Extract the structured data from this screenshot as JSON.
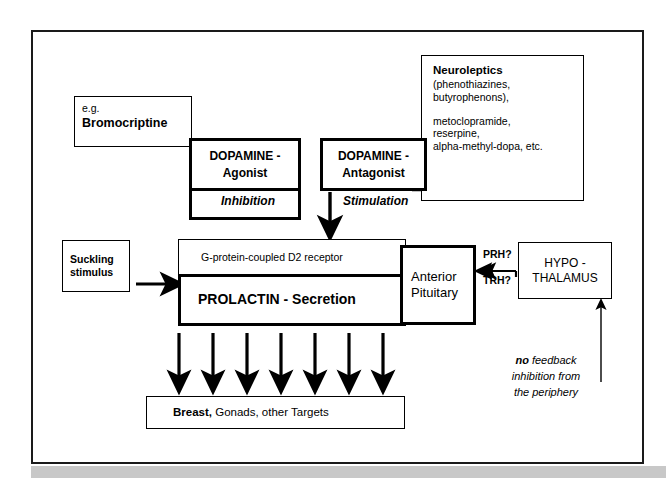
{
  "diagram": {
    "colors": {
      "ink": "#000000",
      "frame": "#1a1a1a",
      "bottom_bar": "#c8c8c8",
      "background": "#ffffff"
    },
    "boxes": {
      "bromocriptine": {
        "line1": "e.g.",
        "line2": "Bromocriptine"
      },
      "dopamine_agonist": {
        "line1": "DOPAMINE -",
        "line2": "Agonist"
      },
      "dopamine_antagonist": {
        "line1": "DOPAMINE -",
        "line2": "Antagonist"
      },
      "neuroleptics": {
        "heading": "Neuroleptics",
        "line1": "(phenothiazines,",
        "line2": "butyrophenons),",
        "line3": "metoclopramide,",
        "line4": "reserpine,",
        "line5": "alpha-methyl-dopa, etc."
      },
      "suckling": {
        "line1": "Suckling",
        "line2": "stimulus"
      },
      "receptor": {
        "label": "G-protein-coupled   D2 receptor"
      },
      "prolactin": {
        "label": "PROLACTIN - Secretion"
      },
      "pituitary": {
        "line1": "Anterior",
        "line2": "Pituitary"
      },
      "hypothalamus": {
        "line1": "HYPO -",
        "line2": "THALAMUS"
      },
      "targets": {
        "bold": "Breast,",
        "rest": "  Gonads,  other Targets"
      }
    },
    "labels": {
      "inhibition": "Inhibition",
      "stimulation": "Stimulation",
      "prh": "PRH?",
      "trh": "TRH?",
      "no_feedback_bold": "no",
      "no_feedback_rest": " feedback",
      "no_feedback_line2": "inhibition from",
      "no_feedback_line3": "the periphery"
    },
    "arrows": {
      "suckling_to_prolactin": "right-arrow",
      "stimulation_down": "down-arrow",
      "hypothalamus_to_pituitary": "left-arrow",
      "periphery_feedback_up": "up-arrow",
      "prolactin_to_targets_count": 7
    }
  }
}
